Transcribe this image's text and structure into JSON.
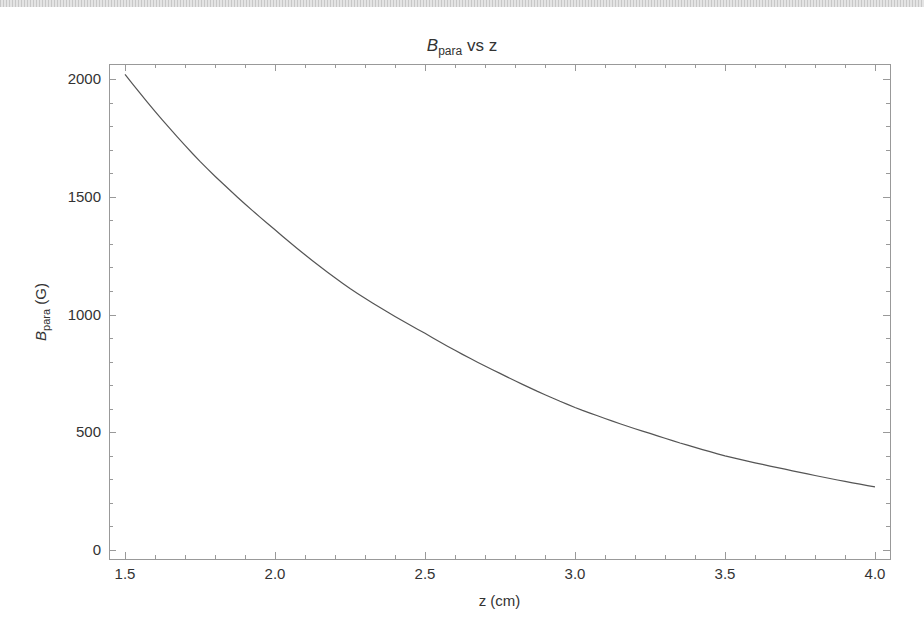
{
  "chart_data": {
    "type": "line",
    "title_parts": {
      "main": "B",
      "sub": "para",
      "rest": " vs z"
    },
    "xlabel": "z (cm)",
    "ylabel": "B_para (G)",
    "ylabel_parts": {
      "main": "B",
      "sub": "para",
      "rest": " (G)"
    },
    "xlim": [
      1.45,
      4.05
    ],
    "ylim": [
      -40,
      2060
    ],
    "x_ticks": [
      1.5,
      2.0,
      2.5,
      3.0,
      3.5,
      4.0
    ],
    "x_tick_labels": [
      "1.5",
      "2.0",
      "2.5",
      "3.0",
      "3.5",
      "4.0"
    ],
    "y_ticks": [
      0,
      500,
      1000,
      1500,
      2000
    ],
    "y_tick_labels": [
      "0",
      "500",
      "1000",
      "1500",
      "2000"
    ],
    "grid": false,
    "legend": null,
    "series": [
      {
        "name": "B_para",
        "color": "#555555",
        "x": [
          1.5,
          1.75,
          2.0,
          2.25,
          2.5,
          2.75,
          3.0,
          3.25,
          3.5,
          3.75,
          4.0
        ],
        "values": [
          2020,
          1650,
          1360,
          1110,
          920,
          750,
          605,
          495,
          400,
          330,
          268
        ]
      }
    ]
  },
  "layout": {
    "frame": {
      "left": 109,
      "top": 64,
      "right": 890,
      "bottom": 559
    },
    "x_px": {
      "v0": 1.5,
      "p0": 125,
      "v1": 4.0,
      "p1": 875
    },
    "y_px": {
      "v0": 0,
      "p0": 550,
      "v1": 2000,
      "p1": 79
    },
    "frame_color": "#999999",
    "tick_color": "#999999"
  }
}
